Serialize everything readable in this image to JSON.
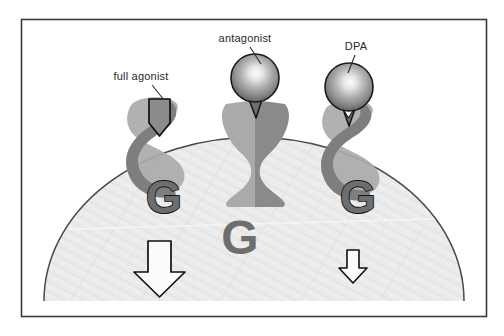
{
  "figure": {
    "frame": {
      "x": 21,
      "y": 19,
      "width": 466,
      "height": 298,
      "stroke_color": "#3a3a3a",
      "fill_color": "#ffffff"
    },
    "membrane": {
      "name": "cell-membrane-dome",
      "fill_color": "#ececec",
      "stroke_color": "#4a4a4a"
    },
    "colors": {
      "receptor_light": "#a8a8a8",
      "receptor_dark": "#808080",
      "ligand_sphere_dark": "#666666",
      "ligand_sphere_light": "#f2f2f2",
      "gprotein_fill": "#6e6e6e",
      "gprotein_outline": "#1a1a1a",
      "arrow_fill": "#fbfbfb",
      "arrow_outline": "#111111",
      "label_color": "#2a2a2a"
    },
    "labels": [
      {
        "id": "full-agonist",
        "text": "full agonist",
        "x": 141,
        "y": 80,
        "anchor": "middle",
        "leader_from": [
          152,
          85
        ],
        "leader_to": [
          163,
          99
        ]
      },
      {
        "id": "antagonist",
        "text": "antagonist",
        "x": 245,
        "y": 42,
        "anchor": "middle",
        "leader_from": [
          250,
          47
        ],
        "leader_to": [
          260,
          64
        ]
      },
      {
        "id": "dpa",
        "text": "DPA",
        "x": 355,
        "y": 50,
        "anchor": "middle",
        "leader_from": [
          354,
          55
        ],
        "leader_to": [
          348,
          72
        ]
      }
    ],
    "receptors": [
      {
        "id": "receptor-full-agonist",
        "type": "twisted-helix",
        "center_x": 157,
        "state": "active",
        "ligand": "pentagon-arrow",
        "g_protein_coupled": true,
        "signal_arrow": "large"
      },
      {
        "id": "receptor-antagonist",
        "type": "straight-hourglass",
        "center_x": 255,
        "state": "inactive",
        "ligand": "sphere",
        "g_protein_coupled": false,
        "signal_arrow": "none"
      },
      {
        "id": "receptor-dpa",
        "type": "twisted-helix",
        "center_x": 352,
        "state": "partially-active",
        "ligand": "sphere-with-triangle",
        "g_protein_coupled": true,
        "signal_arrow": "small"
      }
    ],
    "g_proteins": [
      {
        "id": "g-protein-left",
        "letter": "G",
        "x": 164,
        "y": 198,
        "size": 40,
        "outlined": true
      },
      {
        "id": "g-protein-free",
        "letter": "G",
        "x": 240,
        "y": 236,
        "size": 42,
        "outlined": false
      },
      {
        "id": "g-protein-right",
        "letter": "G",
        "x": 358,
        "y": 198,
        "size": 40,
        "outlined": true
      }
    ],
    "signal_arrows": [
      {
        "id": "signal-arrow-large",
        "x": 159,
        "y": 240,
        "scale": 1.0
      },
      {
        "id": "signal-arrow-small",
        "x": 353,
        "y": 250,
        "scale": 0.52
      }
    ]
  }
}
